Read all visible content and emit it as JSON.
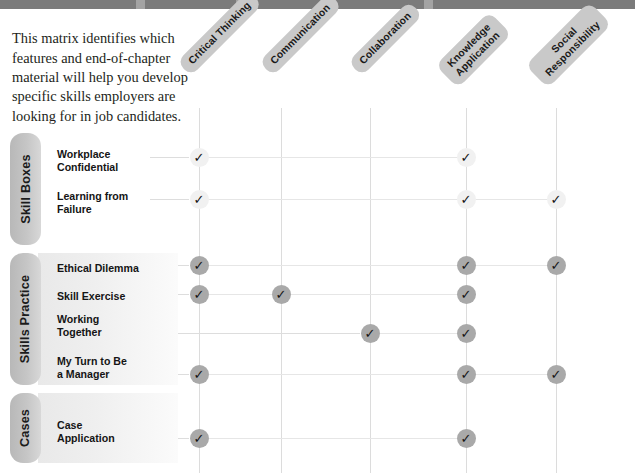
{
  "topbar": {
    "fragment_text": ""
  },
  "intro": {
    "text": "This matrix identifies which features and end-of-chapter material will help you develop specific skills employers are looking for in job candidates."
  },
  "columns": [
    {
      "id": "critical-thinking",
      "label": "Critical Thinking",
      "x": 199
    },
    {
      "id": "communication",
      "label": "Communication",
      "x": 281
    },
    {
      "id": "collaboration",
      "label": "Collaboration",
      "x": 370
    },
    {
      "id": "knowledge-application",
      "label": "Knowledge\nApplication",
      "x": 466
    },
    {
      "id": "social-responsibility",
      "label": "Social\nResponsibility",
      "x": 556
    }
  ],
  "categories": [
    {
      "id": "skill-boxes",
      "label": "Skill Boxes",
      "top": 133,
      "height": 112,
      "band": false
    },
    {
      "id": "skills-practice",
      "label": "Skills Practice",
      "top": 253,
      "height": 132,
      "band": true
    },
    {
      "id": "cases",
      "label": "Cases",
      "top": 393,
      "height": 70,
      "band": true
    }
  ],
  "rows": [
    {
      "id": "workplace-confidential",
      "label": "Workplace\nConfidential",
      "category": "skill-boxes",
      "label_top": 148,
      "mark_y": 157,
      "style": "light",
      "marks": [
        1,
        0,
        0,
        1,
        0
      ]
    },
    {
      "id": "learning-from-failure",
      "label": "Learning from\nFailure",
      "category": "skill-boxes",
      "label_top": 190,
      "mark_y": 199,
      "style": "light",
      "marks": [
        1,
        0,
        0,
        1,
        1
      ]
    },
    {
      "id": "ethical-dilemma",
      "label": "Ethical Dilemma",
      "category": "skills-practice",
      "label_top": 262,
      "mark_y": 265,
      "style": "dark",
      "marks": [
        1,
        0,
        0,
        1,
        1
      ]
    },
    {
      "id": "skill-exercise",
      "label": "Skill Exercise",
      "category": "skills-practice",
      "label_top": 290,
      "mark_y": 294,
      "style": "dark",
      "marks": [
        1,
        1,
        0,
        1,
        0
      ]
    },
    {
      "id": "working-together",
      "label": "Working\nTogether",
      "category": "skills-practice",
      "label_top": 313,
      "mark_y": 333,
      "style": "dark",
      "marks": [
        0,
        0,
        1,
        1,
        0
      ]
    },
    {
      "id": "my-turn-to-be-a-manager",
      "label": "My Turn to Be\na Manager",
      "category": "skills-practice",
      "label_top": 355,
      "mark_y": 374,
      "style": "dark",
      "marks": [
        1,
        0,
        0,
        1,
        1
      ]
    },
    {
      "id": "case-application",
      "label": "Case\nApplication",
      "category": "cases",
      "label_top": 419,
      "mark_y": 438,
      "style": "dark",
      "marks": [
        1,
        0,
        0,
        1,
        0
      ]
    }
  ],
  "icons": {
    "check": "✓"
  },
  "colors": {
    "topbar": "#7b7b7b",
    "header_chip": "#c9c9c9",
    "tab_gradient_start": "#b8b8b8",
    "tab_gradient_end": "#d8d8d8",
    "mark_light": "#f1f1f1",
    "mark_dark": "#a9a9a9",
    "rule": "#dcdcdc",
    "text": "#1a1a1a"
  }
}
